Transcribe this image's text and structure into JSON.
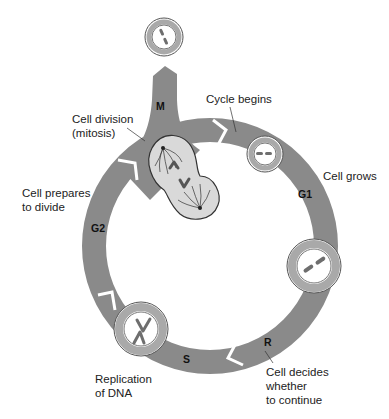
{
  "colors": {
    "ring": "#8a8a8a",
    "cell_ring": "#a9a9a9",
    "cell_fill": "#ffffff",
    "chromosome": "#6e6e6e",
    "dividing_cell_fill": "#d9d9d9",
    "text": "#222222"
  },
  "phases": [
    {
      "id": "M",
      "label": "M"
    },
    {
      "id": "G1",
      "label": "G1"
    },
    {
      "id": "R",
      "label": "R"
    },
    {
      "id": "S",
      "label": "S"
    },
    {
      "id": "G2",
      "label": "G2"
    }
  ],
  "annotations": {
    "cell_division": "Cell division\n(mitosis)",
    "cycle_begins": "Cycle begins",
    "cell_grows": "Cell grows",
    "cell_decides": "Cell decides\nwhether\nto continue",
    "replication": "Replication\nof DNA",
    "cell_prepares": "Cell prepares\nto divide"
  }
}
